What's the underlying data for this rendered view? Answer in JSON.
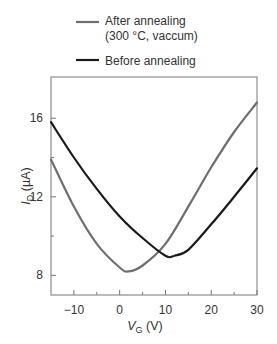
{
  "chart_data": {
    "type": "line",
    "title": "",
    "xlabel": "V_G (V)",
    "ylabel": "I_D (µA)",
    "xlim": [
      -15,
      30
    ],
    "ylim": [
      7,
      18.1
    ],
    "xticks": [
      -10,
      0,
      10,
      20,
      30
    ],
    "yticks": [
      8,
      12,
      16
    ],
    "x_minor_ticks": [
      -5,
      5,
      15,
      25
    ],
    "y_minor_ticks": [
      10,
      14
    ],
    "grid": false,
    "legend_position": "top, above plot",
    "series": [
      {
        "name": "After annealing (300 °C, vaccum)",
        "color": "#6e6e6e",
        "x": [
          -15,
          -10,
          -5,
          0,
          2,
          5,
          10,
          15,
          20,
          25,
          30
        ],
        "y": [
          13.9,
          11.5,
          9.6,
          8.4,
          8.2,
          8.5,
          9.6,
          11.5,
          13.5,
          15.3,
          16.8
        ]
      },
      {
        "name": "Before annealing",
        "color": "#1a1a1a",
        "x": [
          -15,
          -10,
          -5,
          0,
          5,
          10,
          12,
          15,
          20,
          25,
          30
        ],
        "y": [
          15.8,
          14.0,
          12.4,
          11.0,
          9.9,
          9.0,
          9.0,
          9.3,
          10.6,
          12.0,
          13.45
        ]
      }
    ]
  },
  "legend": {
    "after_line1": "After annealing",
    "after_line2": "(300 °C, vaccum)",
    "before": "Before annealing"
  },
  "axes": {
    "x_title_var": "V",
    "x_title_sub": "G",
    "x_title_unit": " (V)",
    "y_title_var": "I",
    "y_title_sub": "D",
    "y_title_unit": " (µA)"
  }
}
